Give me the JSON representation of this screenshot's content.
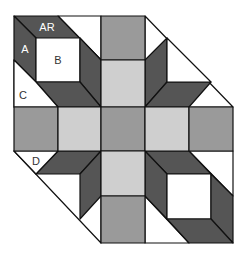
{
  "diagram": {
    "colors": {
      "dark": "#555555",
      "medium": "#9a9a9a",
      "light": "#cfcfcf",
      "white": "#ffffff",
      "outline": "#111111",
      "label_on_dark": "#ffffff",
      "label_on_light": "#333333"
    },
    "labels": {
      "AR": "AR",
      "A": "A",
      "B": "B",
      "C": "C",
      "D": "D"
    }
  }
}
